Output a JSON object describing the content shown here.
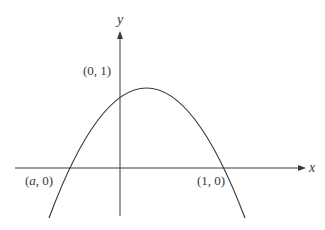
{
  "diagram": {
    "type": "function-graph",
    "curve": "downward parabola",
    "axes": {
      "x_label": "x",
      "y_label": "y"
    },
    "points": [
      {
        "name": "y-intercept",
        "text_open": "(",
        "text_var": "0",
        "text_close": ", 1)",
        "label": "(0, 1)"
      },
      {
        "name": "left-root",
        "text_open": "(",
        "text_var": "a",
        "text_close": ", 0)",
        "label": "(a, 0)"
      },
      {
        "name": "right-root",
        "text_open": "(",
        "text_var": "1",
        "text_close": ", 0)",
        "label": "(1, 0)"
      }
    ],
    "colors": {
      "line": "#3a3a3a",
      "background": "#ffffff"
    }
  }
}
